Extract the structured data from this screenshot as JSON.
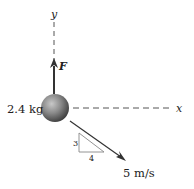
{
  "diagram": {
    "axes": {
      "x_label": "x",
      "y_label": "y"
    },
    "mass": {
      "label": "2.4 kg",
      "value": 2.4,
      "unit": "kg"
    },
    "force": {
      "label": "F",
      "direction": "up (+y)"
    },
    "velocity": {
      "label": "5 m/s",
      "value": 5,
      "unit": "m/s",
      "direction": "down-right"
    },
    "slope_triangle": {
      "rise_label": "3",
      "run_label": "4"
    },
    "colors": {
      "line": "#333333",
      "dashed_axis": "#555555",
      "ball_light": "#b0b0b0",
      "ball_dark": "#3a3a3a",
      "triangle": "#888888"
    }
  }
}
